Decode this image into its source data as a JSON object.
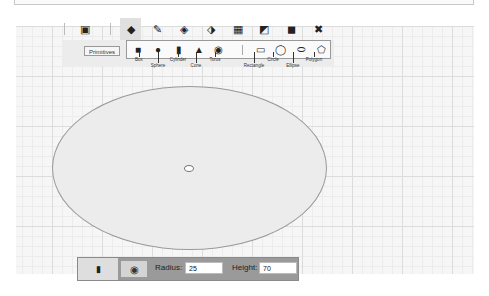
{
  "toolbar": {
    "items": [
      {
        "name": "new-primitive-icon",
        "glyph": "▣"
      },
      {
        "name": "primitives-icon",
        "glyph": "◆"
      },
      {
        "name": "modify-icon",
        "glyph": "✎"
      },
      {
        "name": "boolean-icon",
        "glyph": "◈"
      },
      {
        "name": "transform-icon",
        "glyph": "⬗"
      },
      {
        "name": "array-icon",
        "glyph": "▦"
      },
      {
        "name": "extrude-icon",
        "glyph": "◩"
      },
      {
        "name": "solid-icon",
        "glyph": "◼"
      },
      {
        "name": "delete-icon",
        "glyph": "✖"
      }
    ]
  },
  "primitives": {
    "label": "Primitives",
    "items_3d": [
      {
        "label": "Box",
        "glyph": "■"
      },
      {
        "label": "Sphere",
        "glyph": "●"
      },
      {
        "label": "Cylinder",
        "glyph": "▮"
      },
      {
        "label": "Cone",
        "glyph": "▲"
      },
      {
        "label": "Torus",
        "glyph": "◉"
      }
    ],
    "items_2d": [
      {
        "label": "Rectangle",
        "glyph": "▭"
      },
      {
        "label": "Circle",
        "glyph": "◯"
      },
      {
        "label": "Ellipse",
        "glyph": "⬭"
      },
      {
        "label": "Polygon",
        "glyph": "⬠"
      }
    ]
  },
  "properties": {
    "radius_label": "Radius:",
    "radius_value": "25",
    "height_label": "Height:",
    "height_value": "70"
  },
  "colors": {
    "canvas_bg": "#f6f6f6",
    "shape_fill": "#ececec",
    "shape_stroke": "#9a9a9a",
    "panel_bg": "#9a9a9a"
  }
}
